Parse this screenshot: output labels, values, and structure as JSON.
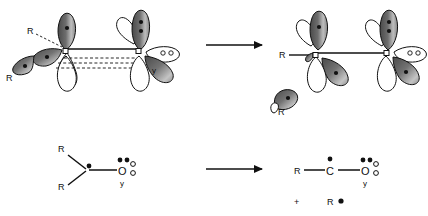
{
  "diagram": {
    "type": "chemistry-reaction-scheme",
    "background_color": "#ffffff",
    "line_color": "#111111",
    "orbital_fill_dark": "#555555",
    "orbital_fill_light": "#e8e8e8"
  },
  "top_row": {
    "reactant": {
      "name": "orbital-reactant-complex",
      "left_center": {
        "substituent_labels": [
          "R",
          "R"
        ],
        "upper_lobe_electrons": 1,
        "lower_lobe_electrons": 1,
        "left_lobe_electrons": 1
      },
      "right_center": {
        "label": "y",
        "vertical_lobe_electrons": 2,
        "horizontal_lobe_electrons": 2,
        "lower_lobe_electrons": 0
      },
      "bond_solid_count": 1,
      "bond_dashed_count": 3
    },
    "arrow": {
      "name": "reaction-arrow-top",
      "direction": "right"
    },
    "product": {
      "name": "orbital-product-complex",
      "left_center": {
        "substituent_label": "R",
        "upper_lobe_electrons": 1,
        "lower_lobe_electrons": 1
      },
      "right_center": {
        "vertical_lobe_electrons": 2,
        "horizontal_lobe_electrons": 2,
        "lower_lobe_electrons": 1
      },
      "bond_solid_count": 1,
      "fragment": {
        "name": "ejected-radical-orbital",
        "label": "R",
        "electrons": 1
      }
    }
  },
  "bottom_row": {
    "reactant": {
      "name": "lewis-reactant",
      "substituent_top": "R",
      "substituent_bottom": "R",
      "center_radical_dots": 1,
      "oxygen_symbol": "O",
      "oxygen_sub_label": "y",
      "oxygen_filled_pair": 2,
      "oxygen_hollow_pair": 2
    },
    "arrow": {
      "name": "reaction-arrow-bottom",
      "direction": "right"
    },
    "product": {
      "name": "lewis-product",
      "substituent_left": "R",
      "carbon_symbol": "C",
      "carbon_radical_dots": 1,
      "oxygen_symbol": "O",
      "oxygen_sub_label": "y",
      "oxygen_filled_pair": 2,
      "oxygen_hollow_pair": 2,
      "plus_sign": "+",
      "radical_fragment_label": "R",
      "radical_fragment_dots": 1
    }
  }
}
